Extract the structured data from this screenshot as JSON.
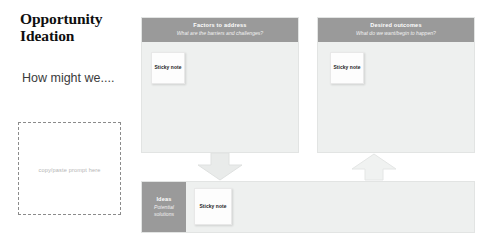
{
  "page": {
    "title": "Opportunity Ideation",
    "lead_text": "How might we....",
    "prompt_dropzone_label": "copy/paste prompt here"
  },
  "colors": {
    "header_gray": "#9a9a9a",
    "panel_fill": "#eef0ef",
    "panel_border": "#e2e4e3",
    "sticky_fill": "#fdfdfd",
    "arrow_fill": "#e9ebea",
    "dashed_border": "#8b8b8b",
    "title_text": "#0f0f0f"
  },
  "board": {
    "panels": [
      {
        "id": "factors",
        "title": "Factors to address",
        "subtitle": "What are the barriers and challenges?",
        "sticky": {
          "label": "Sticky note"
        }
      },
      {
        "id": "outcomes",
        "title": "Desired outcomes",
        "subtitle": "What do we want/begin to happen?",
        "sticky": {
          "label": "Sticky note"
        }
      },
      {
        "id": "ideas",
        "title": "Ideas",
        "subtitle": "Potential solutions",
        "sticky": {
          "label": "Sticky note"
        }
      }
    ],
    "arrows": [
      {
        "id": "arrow-down",
        "direction": "down"
      },
      {
        "id": "arrow-up",
        "direction": "up"
      }
    ]
  }
}
